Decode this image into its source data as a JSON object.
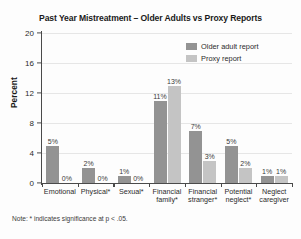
{
  "chart_data": {
    "type": "bar",
    "title": "Past Year Mistreatment – Older Adults vs Proxy Reports",
    "xlabel": "",
    "ylabel": "Percent",
    "ylim": [
      0,
      20
    ],
    "yticks": [
      0,
      4,
      8,
      12,
      16,
      20
    ],
    "ytick_labels": [
      "0",
      "4",
      "8",
      "12",
      "16",
      "20"
    ],
    "grid": true,
    "legend_position": "top-right",
    "categories": [
      "Emotional",
      "Physical*",
      "Sexual*",
      "Financial\nfamily*",
      "Financial\nstranger*",
      "Potential\nneglect*",
      "Neglect\ncaregiver"
    ],
    "series": [
      {
        "name": "Older adult report",
        "color": "#939393",
        "values": [
          5,
          2,
          1,
          11,
          7,
          5,
          1
        ],
        "labels": [
          "5%",
          "2%",
          "1%",
          "11%",
          "7%",
          "5%",
          "1%"
        ]
      },
      {
        "name": "Proxy report",
        "color": "#c4c4c4",
        "values": [
          0,
          0,
          0,
          13,
          3,
          2,
          1
        ],
        "labels": [
          "0%",
          "0%",
          "0%",
          "13%",
          "3%",
          "2%",
          "1%"
        ]
      }
    ],
    "footnote": "Note: * indicates significance at p < .05."
  }
}
